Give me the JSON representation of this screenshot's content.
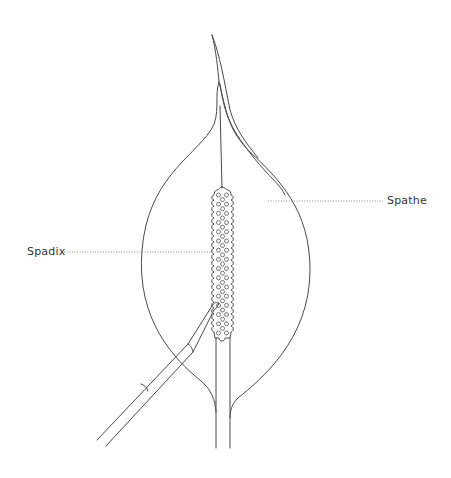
{
  "diagram": {
    "labels": [
      {
        "id": "spadix",
        "text": "Spadix"
      },
      {
        "id": "spathe",
        "text": "Spathe"
      }
    ],
    "colors": {
      "line": "#4a4a4a",
      "leader": "#6a6a6a",
      "text": "#333333",
      "background": "#ffffff"
    }
  }
}
